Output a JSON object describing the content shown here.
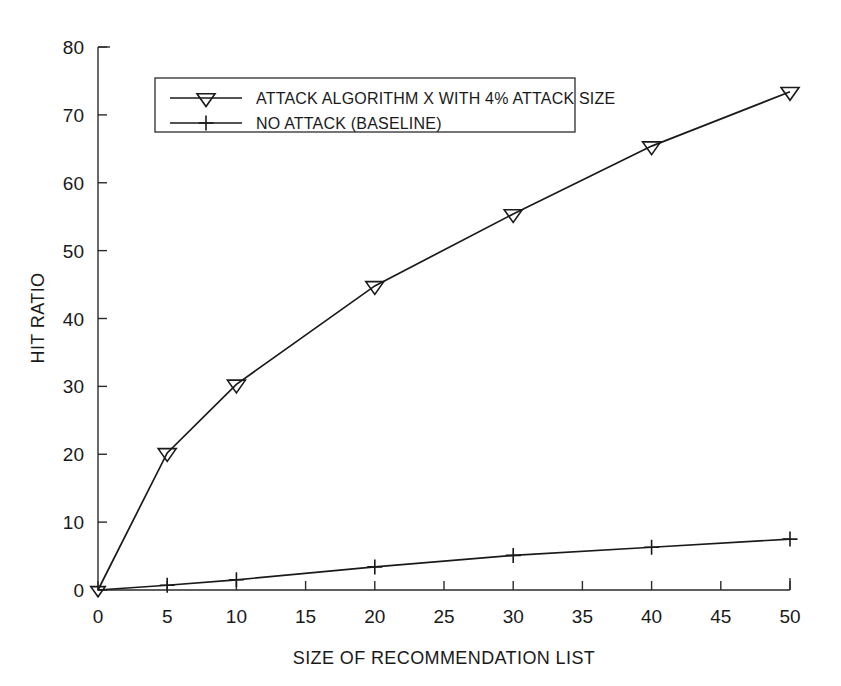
{
  "chart_data": {
    "type": "line",
    "title": "",
    "xlabel": "SIZE OF RECOMMENDATION LIST",
    "ylabel": "HIT RATIO",
    "xlim": [
      0,
      50
    ],
    "ylim": [
      0,
      80
    ],
    "xticks": [
      0,
      5,
      10,
      15,
      20,
      25,
      30,
      35,
      40,
      45,
      50
    ],
    "yticks": [
      0,
      10,
      20,
      30,
      40,
      50,
      60,
      70,
      80
    ],
    "xtick_labels": [
      "0",
      "5",
      "10",
      "15",
      "20",
      "25",
      "30",
      "35",
      "40",
      "45",
      "50"
    ],
    "ytick_labels": [
      "0",
      "10",
      "20",
      "30",
      "40",
      "50",
      "60",
      "70",
      "80"
    ],
    "grid": false,
    "legend_position": "upper-left-inside",
    "x": [
      0,
      5,
      10,
      20,
      30,
      40,
      50
    ],
    "series": [
      {
        "name": "ATTACK ALGORITHM X WITH 4% ATTACK SIZE",
        "marker": "triangle-down",
        "color": "#1a1a1a",
        "values": [
          0,
          20.2,
          30.3,
          44.8,
          55.4,
          65.4,
          73.4
        ]
      },
      {
        "name": "NO ATTACK (BASELINE)",
        "marker": "plus",
        "color": "#1a1a1a",
        "values": [
          0,
          0.7,
          1.5,
          3.4,
          5.1,
          6.3,
          7.5
        ]
      }
    ]
  },
  "legend": {
    "entries": [
      {
        "label": "ATTACK ALGORITHM X WITH 4% ATTACK SIZE",
        "marker": "triangle-down-icon"
      },
      {
        "label": "NO ATTACK (BASELINE)",
        "marker": "plus-icon"
      }
    ]
  },
  "axes": {
    "x_title": "SIZE OF RECOMMENDATION LIST",
    "y_title": "HIT RATIO"
  }
}
